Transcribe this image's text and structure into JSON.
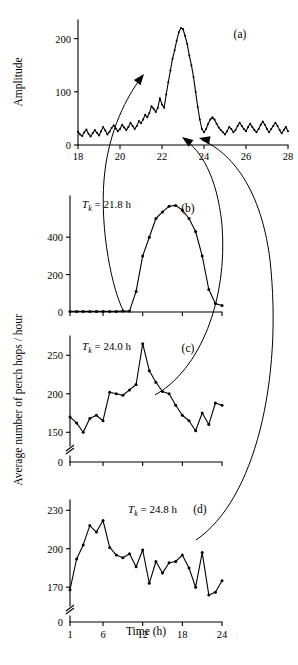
{
  "figure": {
    "ylabel_upper": "Amplitude",
    "ylabel_lower": "Average number of perch hops / hour",
    "xlabel": "Time (h)"
  },
  "chart_data": [
    {
      "type": "line",
      "panel": "(a)",
      "title": "",
      "xlabel": "",
      "ylabel": "Amplitude",
      "xlim": [
        18,
        28
      ],
      "ylim": [
        0,
        235
      ],
      "xticks": [
        18,
        20,
        22,
        24,
        26,
        28
      ],
      "xticklabels": [
        "18",
        "20",
        "22",
        "24",
        "26",
        "28"
      ],
      "yticks": [
        0,
        100,
        200
      ],
      "yticklabels": [
        "0",
        "100",
        "200"
      ],
      "grid": false,
      "markers": true,
      "x": [
        18.0,
        18.1,
        18.2,
        18.3,
        18.4,
        18.5,
        18.6,
        18.7,
        18.8,
        18.9,
        19.0,
        19.1,
        19.2,
        19.3,
        19.4,
        19.5,
        19.6,
        19.7,
        19.8,
        19.9,
        20.0,
        20.1,
        20.2,
        20.3,
        20.4,
        20.5,
        20.6,
        20.7,
        20.8,
        20.9,
        21.0,
        21.1,
        21.2,
        21.3,
        21.4,
        21.5,
        21.6,
        21.7,
        21.8,
        21.9,
        22.0,
        22.1,
        22.2,
        22.3,
        22.4,
        22.5,
        22.6,
        22.7,
        22.8,
        22.9,
        23.0,
        23.1,
        23.2,
        23.3,
        23.4,
        23.5,
        23.6,
        23.7,
        23.8,
        23.9,
        24.0,
        24.1,
        24.2,
        24.3,
        24.4,
        24.5,
        24.6,
        24.7,
        24.8,
        24.9,
        25.0,
        25.1,
        25.2,
        25.3,
        25.4,
        25.5,
        25.6,
        25.7,
        25.8,
        25.9,
        26.0,
        26.1,
        26.2,
        26.3,
        26.4,
        26.5,
        26.6,
        26.7,
        26.8,
        26.9,
        27.0,
        27.1,
        27.2,
        27.3,
        27.4,
        27.5,
        27.6,
        27.7,
        27.8,
        27.9,
        28.0
      ],
      "values": [
        25,
        20,
        17,
        24,
        29,
        21,
        16,
        22,
        28,
        23,
        18,
        26,
        34,
        27,
        20,
        25,
        32,
        37,
        31,
        26,
        30,
        38,
        33,
        28,
        34,
        42,
        36,
        30,
        36,
        45,
        41,
        48,
        57,
        52,
        60,
        73,
        68,
        62,
        70,
        88,
        76,
        70,
        95,
        118,
        140,
        162,
        178,
        196,
        212,
        220,
        218,
        205,
        190,
        168,
        150,
        128,
        100,
        72,
        48,
        30,
        24,
        30,
        40,
        48,
        52,
        48,
        40,
        33,
        28,
        24,
        20,
        26,
        34,
        30,
        24,
        28,
        36,
        42,
        36,
        30,
        26,
        34,
        40,
        34,
        28,
        24,
        30,
        38,
        44,
        38,
        30,
        24,
        30,
        36,
        42,
        36,
        28,
        22,
        28,
        34,
        26
      ]
    },
    {
      "type": "line",
      "panel": "(b)",
      "annotation": "T_k = 21.8 h",
      "annotation_prefix": "T",
      "annotation_sub": "k",
      "annotation_suffix": " = 21.8 h",
      "xlabel": "",
      "ylabel": "Average number of perch hops / hour",
      "xlim": [
        1,
        24
      ],
      "ylim": [
        0,
        620
      ],
      "xticks": [
        1,
        6,
        12,
        18,
        24
      ],
      "xticklabels": [
        "",
        "",
        "",
        "",
        ""
      ],
      "yticks": [
        0,
        200,
        400
      ],
      "yticklabels": [
        "0",
        "200",
        "400"
      ],
      "grid": false,
      "markers": true,
      "x": [
        1,
        2,
        3,
        4,
        5,
        6,
        7,
        8,
        9,
        10,
        11,
        12,
        13,
        14,
        15,
        16,
        17,
        18,
        19,
        20,
        21,
        22,
        23,
        24
      ],
      "values": [
        3,
        3,
        3,
        3,
        3,
        3,
        3,
        3,
        5,
        5,
        110,
        300,
        400,
        500,
        535,
        565,
        570,
        545,
        500,
        430,
        300,
        120,
        45,
        35
      ]
    },
    {
      "type": "line",
      "panel": "(c)",
      "annotation": "T_k = 24.0 h",
      "annotation_prefix": "T",
      "annotation_sub": "k",
      "annotation_suffix": " = 24.0 h",
      "xlabel": "",
      "ylabel": "Average number of perch hops / hour",
      "xlim": [
        1,
        24
      ],
      "ylim": [
        140,
        275
      ],
      "yaxis_break": true,
      "xticks": [
        1,
        6,
        12,
        18,
        24
      ],
      "xticklabels": [
        "",
        "",
        "",
        "",
        ""
      ],
      "yticks": [
        0,
        150,
        200,
        250
      ],
      "yticklabels": [
        "0",
        "150",
        "200",
        "250"
      ],
      "grid": false,
      "markers": true,
      "x": [
        1,
        2,
        3,
        4,
        5,
        6,
        7,
        8,
        9,
        10,
        11,
        12,
        13,
        14,
        15,
        16,
        17,
        18,
        19,
        20,
        21,
        22,
        23,
        24
      ],
      "values": [
        170,
        162,
        150,
        168,
        172,
        165,
        202,
        200,
        198,
        205,
        212,
        265,
        230,
        215,
        203,
        200,
        185,
        172,
        165,
        152,
        175,
        160,
        188,
        185
      ]
    },
    {
      "type": "line",
      "panel": "(d)",
      "annotation": "T_k = 24.8 h",
      "annotation_prefix": "T",
      "annotation_sub": "k",
      "annotation_suffix": " = 24.8 h",
      "xlabel": "Time (h)",
      "ylabel": "Average number of perch hops / hour",
      "xlim": [
        1,
        24
      ],
      "ylim": [
        160,
        238
      ],
      "yaxis_break": true,
      "xticks": [
        1,
        6,
        12,
        18,
        24
      ],
      "xticklabels": [
        "1",
        "6",
        "12",
        "18",
        "24"
      ],
      "yticks": [
        0,
        170,
        200,
        230
      ],
      "yticklabels": [
        "0",
        "170",
        "200",
        "230"
      ],
      "grid": false,
      "markers": true,
      "x": [
        1,
        2,
        3,
        4,
        5,
        6,
        7,
        8,
        9,
        10,
        11,
        12,
        13,
        14,
        15,
        16,
        17,
        18,
        19,
        20,
        21,
        22,
        23,
        24
      ],
      "values": [
        168,
        192,
        203,
        218,
        213,
        222,
        201,
        195,
        193,
        196,
        186,
        199,
        173,
        190,
        181,
        189,
        190,
        195,
        185,
        170,
        197,
        164,
        166,
        175
      ]
    }
  ],
  "connectors": [
    {
      "name": "connector-b-to-a",
      "from_panel": "(b)",
      "to_panel": "(a)",
      "target_x": 21.8
    },
    {
      "name": "connector-c-to-a",
      "from_panel": "(c)",
      "to_panel": "(a)",
      "target_x": 24.0
    },
    {
      "name": "connector-d-to-a",
      "from_panel": "(d)",
      "to_panel": "(a)",
      "target_x": 24.8
    }
  ]
}
